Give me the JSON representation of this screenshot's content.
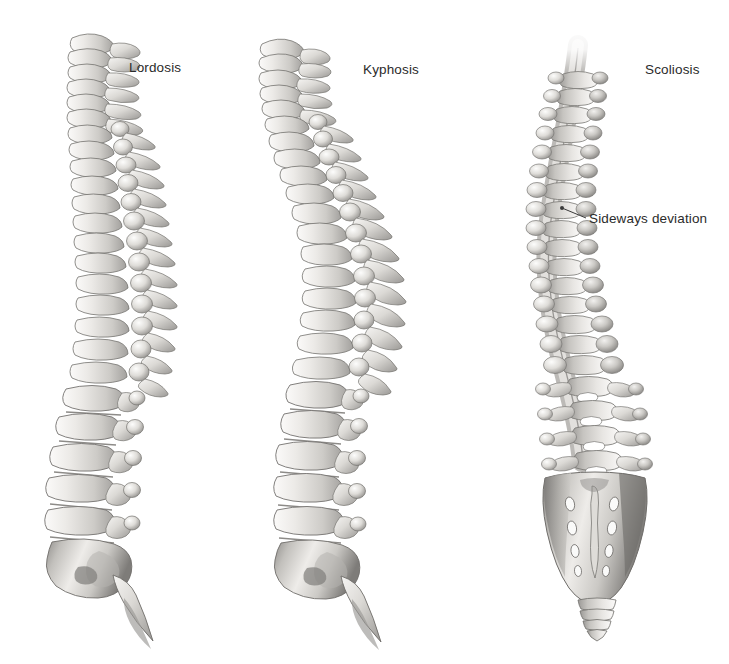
{
  "figure": {
    "background_color": "#ffffff",
    "text_color": "#2b2b2b",
    "bone_light": "#f2f1ef",
    "bone_mid": "#c9c7c4",
    "bone_dark": "#8e8c89",
    "outline_color": "#6b6966",
    "width": 729,
    "height": 664,
    "style": "grayscale anatomical illustration"
  },
  "panels": [
    {
      "id": "lordosis",
      "label": "Lordosis",
      "view": "lateral (side) view",
      "label_x": 129,
      "label_y": 60
    },
    {
      "id": "kyphosis",
      "label": "Kyphosis",
      "view": "lateral (side) view",
      "label_x": 363,
      "label_y": 62
    },
    {
      "id": "scoliosis",
      "label": "Scoliosis",
      "view": "posterior (back) view",
      "label_x": 645,
      "label_y": 62
    }
  ],
  "callouts": [
    {
      "id": "sideways-deviation",
      "label": "Sideways deviation",
      "label_x": 589,
      "label_y": 211,
      "leader_from_x": 562,
      "leader_from_y": 208,
      "leader_to_x": 586,
      "leader_to_y": 218,
      "panel": "scoliosis"
    }
  ]
}
